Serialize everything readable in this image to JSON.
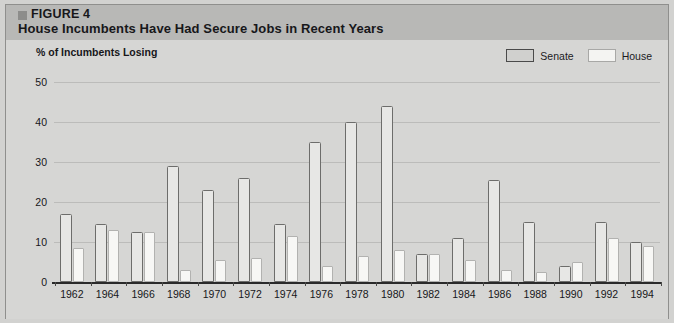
{
  "figure": {
    "marker_icon": "square-marker-icon",
    "label": "FIGURE 4",
    "title": "House Incumbents Have Had Secure Jobs in Recent Years"
  },
  "legend": {
    "position": "top-right",
    "items": [
      {
        "label": "Senate",
        "swatch": "senate-swatch",
        "color": "#e7e7e5"
      },
      {
        "label": "House",
        "swatch": "house-swatch",
        "color": "#f7f7f5"
      }
    ]
  },
  "chart_data": {
    "type": "bar",
    "title": "House Incumbents Have Had Secure Jobs in Recent Years",
    "xlabel": "",
    "ylabel": "% of Incumbents Losing",
    "ylim": [
      0,
      50
    ],
    "yticks": [
      0,
      10,
      20,
      30,
      40,
      50
    ],
    "grid": true,
    "categories": [
      "1962",
      "1964",
      "1966",
      "1968",
      "1970",
      "1972",
      "1974",
      "1976",
      "1978",
      "1980",
      "1982",
      "1984",
      "1986",
      "1988",
      "1990",
      "1992",
      "1994"
    ],
    "series": [
      {
        "name": "Senate",
        "values": [
          17,
          14.5,
          12.5,
          29,
          23,
          26,
          14.5,
          35,
          40,
          44,
          7,
          11,
          25.5,
          15,
          4,
          15,
          10
        ]
      },
      {
        "name": "House",
        "values": [
          8.5,
          13,
          12.5,
          3,
          5.5,
          6,
          11.5,
          4,
          6.5,
          8,
          7,
          5.5,
          3,
          2.5,
          5,
          11,
          9
        ]
      }
    ]
  },
  "colors": {
    "background": "#d6d6d4",
    "header_band": "#b8b8b6",
    "senate_bar": "#e7e7e5",
    "senate_outline": "#6d6d6b",
    "house_bar": "#f7f7f5",
    "house_outline": "#b2b2b0",
    "gridline": "#bcbcba",
    "axis": "#2a2a2a",
    "text": "#17171a"
  }
}
